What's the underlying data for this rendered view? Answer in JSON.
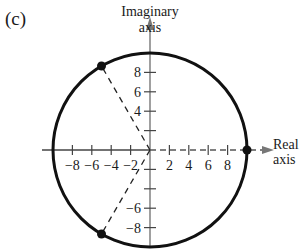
{
  "panel_label": "(c)",
  "chart_data": {
    "type": "scatter",
    "title": "",
    "panel": "(c)",
    "xlabel": "Real axis",
    "ylabel": "Imaginary axis",
    "xlabel_lines": [
      "Real",
      "axis"
    ],
    "ylabel_lines": [
      "Imaginary",
      "axis"
    ],
    "xlim": [
      -10,
      10
    ],
    "ylim": [
      -10,
      10
    ],
    "x_ticks": [
      -8,
      -6,
      -4,
      -2,
      2,
      4,
      6,
      8
    ],
    "x_tick_labels": [
      "−8",
      "−6",
      "−4",
      "−2",
      "2",
      "4",
      "6",
      "8"
    ],
    "y_ticks_labeled": [
      8,
      6,
      4,
      -6,
      -8
    ],
    "y_tick_labels": [
      "8",
      "6",
      "4",
      "−6",
      "−8"
    ],
    "y_ticks_unlabeled": [
      2,
      -2,
      -4
    ],
    "grid": false,
    "circle": {
      "center": [
        0,
        0
      ],
      "radius": 10
    },
    "points": [
      {
        "x": 10,
        "y": 0,
        "angle_deg": 0
      },
      {
        "x": -5,
        "y": 8.66,
        "angle_deg": 120
      },
      {
        "x": -5,
        "y": -8.66,
        "angle_deg": 240
      }
    ],
    "dashed_rays": [
      {
        "from": [
          0,
          0
        ],
        "to": [
          10,
          0
        ]
      },
      {
        "from": [
          0,
          0
        ],
        "to": [
          -5,
          8.66
        ]
      },
      {
        "from": [
          0,
          0
        ],
        "to": [
          -5,
          -8.66
        ]
      }
    ]
  }
}
